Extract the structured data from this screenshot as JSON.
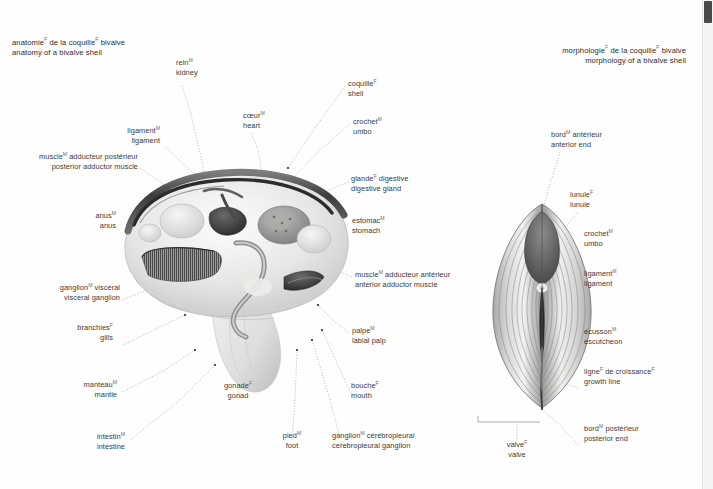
{
  "page": {
    "background": "#fefefe",
    "text_color": "#3a3a3a",
    "superscript_color": "#6a6a6a"
  },
  "scrollbar": {
    "name": "vertical-scrollbar",
    "thumb_color": "#4a4a4a",
    "track_color": "#f4f4f4"
  },
  "figures": {
    "left": {
      "title_fr": "anatomie",
      "title_fr_sup": "F",
      "title_fr_rest": " de la coquille",
      "title_fr_sup2": "F",
      "title_fr_tail": " bivalve",
      "title_en": "anatomy of a bivalve shell"
    },
    "right": {
      "title_fr": "morphologie",
      "title_fr_sup": "F",
      "title_fr_rest": " de la coquille",
      "title_fr_sup2": "F",
      "title_fr_tail": " bivalve",
      "title_en": "morphology of a bivalve shell"
    }
  },
  "labels_left": [
    {
      "id": "kidney",
      "fr": "rein",
      "sup": "M",
      "fr_rest": "",
      "en": "kidney"
    },
    {
      "id": "heart",
      "fr": "cœur",
      "sup": "M",
      "fr_rest": "",
      "en": "heart"
    },
    {
      "id": "ligament",
      "fr": "ligament",
      "sup": "M",
      "fr_rest": "",
      "en": "ligament"
    },
    {
      "id": "posterior-adductor-muscle",
      "fr": "muscle",
      "sup": "M",
      "fr_rest": " adducteur postérieur",
      "en": "posterior adductor muscle"
    },
    {
      "id": "anus",
      "fr": "anus",
      "sup": "M",
      "fr_rest": "",
      "en": "anus"
    },
    {
      "id": "visceral-ganglion",
      "fr": "ganglion",
      "sup": "M",
      "fr_rest": " viscéral",
      "en": "visceral ganglion"
    },
    {
      "id": "gills",
      "fr": "branchies",
      "sup": "F",
      "fr_rest": "",
      "en": "gills"
    },
    {
      "id": "mantle",
      "fr": "manteau",
      "sup": "M",
      "fr_rest": "",
      "en": "mantle"
    },
    {
      "id": "intestine",
      "fr": "intestin",
      "sup": "M",
      "fr_rest": "",
      "en": "intestine"
    },
    {
      "id": "gonad",
      "fr": "gonade",
      "sup": "F",
      "fr_rest": "",
      "en": "gonad"
    },
    {
      "id": "foot",
      "fr": "pied",
      "sup": "M",
      "fr_rest": "",
      "en": "foot"
    },
    {
      "id": "cerebropleural-ganglion",
      "fr": "ganglion",
      "sup": "M",
      "fr_rest": " cérébropleural",
      "en": "cerebropleural ganglion"
    },
    {
      "id": "mouth",
      "fr": "bouche",
      "sup": "F",
      "fr_rest": "",
      "en": "mouth"
    },
    {
      "id": "labial-palp",
      "fr": "palpe",
      "sup": "M",
      "fr_rest": "",
      "en": "labial palp"
    },
    {
      "id": "anterior-adductor-muscle",
      "fr": "muscle",
      "sup": "M",
      "fr_rest": " adducteur antérieur",
      "en": "anterior adductor muscle"
    },
    {
      "id": "stomach",
      "fr": "estomac",
      "sup": "M",
      "fr_rest": "",
      "en": "stomach"
    },
    {
      "id": "digestive-gland",
      "fr": "glande",
      "sup": "F",
      "fr_rest": " digestive",
      "en": "digestive gland"
    },
    {
      "id": "umbo",
      "fr": "crochet",
      "sup": "M",
      "fr_rest": "",
      "en": "umbo"
    },
    {
      "id": "shell",
      "fr": "coquille",
      "sup": "F",
      "fr_rest": "",
      "en": "shell"
    }
  ],
  "labels_right": [
    {
      "id": "anterior-end",
      "fr": "bord",
      "sup": "M",
      "fr_rest": " antérieur",
      "en": "anterior end"
    },
    {
      "id": "lunule",
      "fr": "lunule",
      "sup": "F",
      "fr_rest": "",
      "en": "lunule"
    },
    {
      "id": "umbo",
      "fr": "crochet",
      "sup": "M",
      "fr_rest": "",
      "en": "umbo"
    },
    {
      "id": "ligament",
      "fr": "ligament",
      "sup": "M",
      "fr_rest": "",
      "en": "ligament"
    },
    {
      "id": "escutcheon",
      "fr": "écusson",
      "sup": "M",
      "fr_rest": "",
      "en": "escutcheon"
    },
    {
      "id": "growth-line",
      "fr": "ligne",
      "sup": "F",
      "fr_rest": " de croissance",
      "sup2": "F",
      "en": "growth line"
    },
    {
      "id": "posterior-end",
      "fr": "bord",
      "sup": "M",
      "fr_rest": " postérieur",
      "en": "posterior end"
    },
    {
      "id": "valve",
      "fr": "valve",
      "sup": "F",
      "fr_rest": "",
      "en": "valve"
    }
  ]
}
